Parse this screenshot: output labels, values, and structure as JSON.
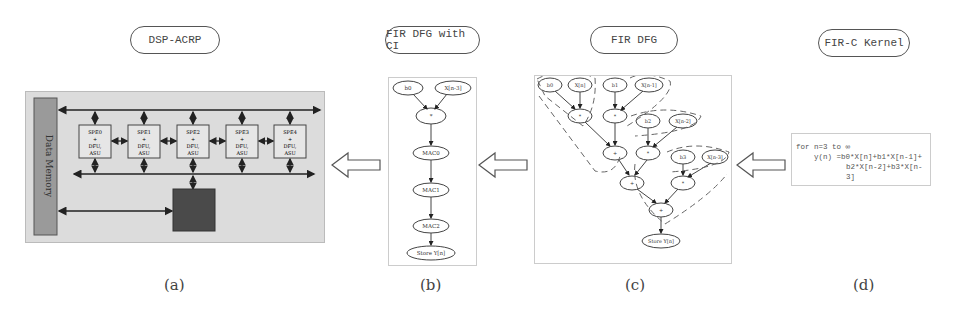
{
  "panels": {
    "a": {
      "title": "DSP-ACRP",
      "caption": "(a)",
      "memory_label": "Data Memory",
      "pe_units": [
        {
          "line1": "SPE0",
          "line2": "+",
          "line3": "DFU,",
          "line4": "ASU"
        },
        {
          "line1": "SPE1",
          "line2": "+",
          "line3": "DFU,",
          "line4": "ASU"
        },
        {
          "line1": "SPE2",
          "line2": "+",
          "line3": "DFU,",
          "line4": "ASU"
        },
        {
          "line1": "SPE3",
          "line2": "+",
          "line3": "DFU,",
          "line4": "ASU"
        },
        {
          "line1": "SPE4",
          "line2": "+",
          "line3": "DFU,",
          "line4": "ASU"
        }
      ],
      "controller_label": "Controller"
    },
    "b": {
      "title": "FIR DFG with CI",
      "caption": "(b)",
      "nodes": [
        "b0",
        "X[n-3]",
        "*",
        "MAC0",
        "MAC1",
        "MAC2",
        "Store Y[n]"
      ]
    },
    "c": {
      "title": "FIR DFG",
      "caption": "(c)",
      "nodes": {
        "row1": [
          "b0",
          "X[n]",
          "b1",
          "X[n-1]"
        ],
        "mul1": [
          "*",
          "*"
        ],
        "row2": [
          "b2",
          "X[n-2]"
        ],
        "add1": "+",
        "mul2": "*",
        "row3": [
          "b3",
          "X[n-3]"
        ],
        "add2": "+",
        "mul3": "*",
        "add3": "+",
        "store": "Store Y[n]"
      }
    },
    "d": {
      "title": "FIR-C Kernel",
      "caption": "(d)",
      "code_lines": [
        "for n=3 to ∞",
        "y(n) =b0*X[n]+b1*X[n-1]+",
        "b2*X[n-2]+b3*X[n-3]"
      ]
    }
  },
  "colors": {
    "panel_a_bg": "#dcdcdc",
    "memory_fill": "#9a9a9a",
    "controller_fill": "#4a4a4a",
    "line": "#333333"
  }
}
